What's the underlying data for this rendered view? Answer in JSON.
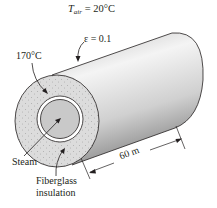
{
  "figure": {
    "air_label": {
      "symbol": "T",
      "subscript": "air",
      "value": "= 20°C"
    },
    "emissivity_label": "ε = 0.1",
    "surface_temp_label": "170°C",
    "steam_label": "Steam",
    "insulation_label_line1": "Fiberglass",
    "insulation_label_line2": "insulation",
    "length_label": "60 m",
    "colors": {
      "line": "#231f20",
      "cylinder_light": "#f2f2f2",
      "cylinder_mid": "#cfcfcf",
      "cylinder_dark": "#9a9a9a",
      "insulation_fill": "#d9d9d9",
      "pipe_fill": "#c8c8c8"
    }
  }
}
